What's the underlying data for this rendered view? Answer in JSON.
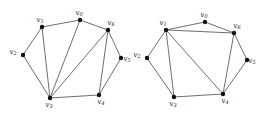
{
  "figure": {
    "name": "two-graph-diagram",
    "background_color": "#ffffff",
    "edge_color": "#4a4a4a",
    "vertex_color": "#111111",
    "label_color": "#1a1a1a"
  },
  "graphs": [
    {
      "id": "left-graph",
      "name": "Left graph",
      "vertices": [
        {
          "id": "v0",
          "base": "v",
          "sub": "0",
          "x": 80,
          "y": 20,
          "label_dx": -1,
          "label_dy": -7
        },
        {
          "id": "v1",
          "base": "v",
          "sub": "1",
          "x": 42,
          "y": 27,
          "label_dx": -2,
          "label_dy": -7
        },
        {
          "id": "v2",
          "base": "v",
          "sub": "2",
          "x": 23,
          "y": 55,
          "label_dx": -10,
          "label_dy": -3
        },
        {
          "id": "v3",
          "base": "v",
          "sub": "3",
          "x": 50,
          "y": 98,
          "label_dx": -1,
          "label_dy": 7
        },
        {
          "id": "v4",
          "base": "v",
          "sub": "4",
          "x": 99,
          "y": 95,
          "label_dx": 2,
          "label_dy": 7
        },
        {
          "id": "v5",
          "base": "v",
          "sub": "5",
          "x": 121,
          "y": 58,
          "label_dx": 6,
          "label_dy": 1
        },
        {
          "id": "v6",
          "base": "v",
          "sub": "6",
          "x": 108,
          "y": 30,
          "label_dx": 3,
          "label_dy": -7
        }
      ],
      "edges": [
        [
          "v1",
          "v0"
        ],
        [
          "v0",
          "v6"
        ],
        [
          "v1",
          "v2"
        ],
        [
          "v2",
          "v3"
        ],
        [
          "v1",
          "v3"
        ],
        [
          "v0",
          "v3"
        ],
        [
          "v6",
          "v3"
        ],
        [
          "v6",
          "v5"
        ],
        [
          "v6",
          "v4"
        ],
        [
          "v5",
          "v4"
        ],
        [
          "v3",
          "v4"
        ]
      ]
    },
    {
      "id": "right-graph",
      "name": "Right graph",
      "vertices": [
        {
          "id": "v0",
          "base": "v",
          "sub": "0",
          "x": 205,
          "y": 22,
          "label_dx": -1,
          "label_dy": -7
        },
        {
          "id": "v1",
          "base": "v",
          "sub": "1",
          "x": 166,
          "y": 30,
          "label_dx": -3,
          "label_dy": -7
        },
        {
          "id": "v2",
          "base": "v",
          "sub": "2",
          "x": 147,
          "y": 58,
          "label_dx": -10,
          "label_dy": -3
        },
        {
          "id": "v3",
          "base": "v",
          "sub": "3",
          "x": 174,
          "y": 97,
          "label_dx": -1,
          "label_dy": 7
        },
        {
          "id": "v4",
          "base": "v",
          "sub": "4",
          "x": 223,
          "y": 94,
          "label_dx": 2,
          "label_dy": 7
        },
        {
          "id": "v5",
          "base": "v",
          "sub": "5",
          "x": 247,
          "y": 60,
          "label_dx": 5,
          "label_dy": 1
        },
        {
          "id": "v6",
          "base": "v",
          "sub": "6",
          "x": 234,
          "y": 33,
          "label_dx": 3,
          "label_dy": -7
        }
      ],
      "edges": [
        [
          "v1",
          "v0"
        ],
        [
          "v0",
          "v6"
        ],
        [
          "v1",
          "v6"
        ],
        [
          "v1",
          "v2"
        ],
        [
          "v2",
          "v3"
        ],
        [
          "v1",
          "v3"
        ],
        [
          "v1",
          "v4"
        ],
        [
          "v3",
          "v4"
        ],
        [
          "v4",
          "v6"
        ],
        [
          "v4",
          "v5"
        ],
        [
          "v5",
          "v6"
        ]
      ]
    }
  ]
}
